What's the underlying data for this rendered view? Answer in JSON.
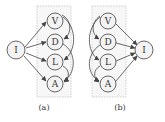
{
  "panels": [
    {
      "id": "a",
      "caption": "(a)",
      "hub": {
        "label": "I"
      },
      "nodes": [
        {
          "label": "V"
        },
        {
          "label": "D"
        },
        {
          "label": "L"
        },
        {
          "label": "A"
        }
      ],
      "hub_edges": [
        "I->V",
        "I->D",
        "I->L",
        "I->A"
      ],
      "chain_edges": [
        "V->L",
        "V->D",
        "D->A",
        "L->A"
      ]
    },
    {
      "id": "b",
      "caption": "(b)",
      "hub": {
        "label": "I"
      },
      "nodes": [
        {
          "label": "V"
        },
        {
          "label": "D"
        },
        {
          "label": "L"
        },
        {
          "label": "A"
        }
      ],
      "hub_edges": [
        "V->I",
        "D->I",
        "L->I",
        "A->I"
      ],
      "chain_edges": [
        "V->D",
        "V->L",
        "D->A",
        "L->A"
      ]
    }
  ],
  "colors": {
    "node_fill": "#f3f3f3",
    "node_stroke": "#555555",
    "box_fill": "#f7f7f7",
    "box_stroke": "#bdbdbd",
    "edge": "#444444"
  }
}
